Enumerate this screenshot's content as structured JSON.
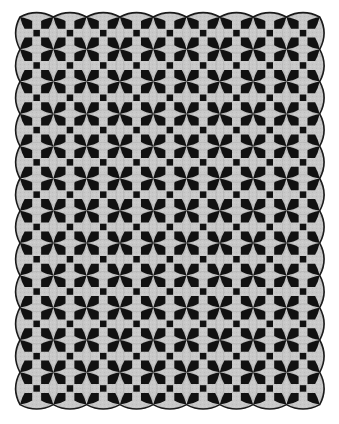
{
  "image": {
    "subject": "scalloped-edge pieced quilt",
    "background_color": "#ffffff",
    "fabric_light_color": "#c9c9c9",
    "fabric_dark_color": "#111111",
    "edge_color": "#1a1a1a"
  },
  "quilt": {
    "left": 20,
    "top": 17,
    "columns": 9,
    "rows": 12,
    "cell_width": 33.3,
    "cell_height": 32.3,
    "center_square_size": 6.5,
    "kite_length": 14,
    "kite_width": 8
  }
}
